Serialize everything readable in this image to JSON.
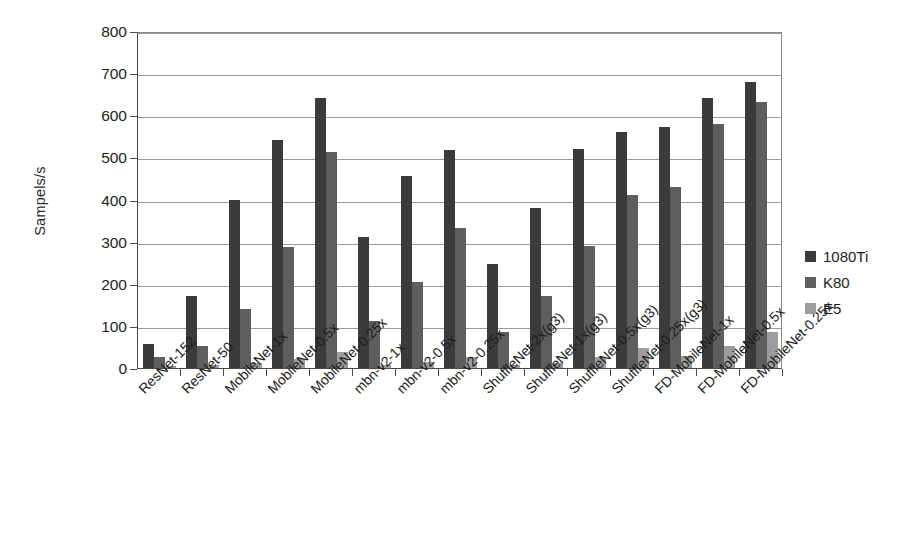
{
  "chart_data": {
    "type": "bar",
    "title": "",
    "xlabel": "",
    "ylabel": "Sampels/s",
    "ylim": [
      0,
      800
    ],
    "ytick_step": 100,
    "yticks": [
      0,
      100,
      200,
      300,
      400,
      500,
      600,
      700,
      800
    ],
    "grid": true,
    "legend_position": "right",
    "categories": [
      "ResNet-152",
      "ResNet-50",
      "MobileNet-1x",
      "MobileNet-0.5x",
      "MobileNet-0.25x",
      "mbn-v2-1x",
      "mbn-v2-0.5x",
      "mbn-v2-0.25x",
      "ShuffleNet-2x(g3)",
      "ShuffleNet-1x(g3)",
      "ShuffleNet-0.5x(g3)",
      "ShuffleNet-0.25x(g3)",
      "FD-MobileNet-1x",
      "FD-MobileNet-0.5x",
      "FD-MobileNet-0.25x"
    ],
    "series": [
      {
        "name": "1080Ti",
        "color": "#3b3b3b",
        "values": [
          57,
          170,
          398,
          542,
          642,
          311,
          457,
          517,
          248,
          380,
          520,
          560,
          572,
          642,
          680
        ]
      },
      {
        "name": "K80",
        "color": "#5e5e5e",
        "values": [
          25,
          52,
          139,
          287,
          513,
          112,
          205,
          333,
          86,
          172,
          290,
          410,
          430,
          580,
          632
        ]
      },
      {
        "name": "E5",
        "color": "#9d9d9d",
        "values": [
          5,
          8,
          12,
          22,
          38,
          7,
          14,
          25,
          7,
          13,
          25,
          47,
          28,
          52,
          85
        ]
      }
    ]
  },
  "legend": {
    "items": [
      {
        "label": "1080Ti"
      },
      {
        "label": "K80"
      },
      {
        "label": "E5"
      }
    ]
  }
}
